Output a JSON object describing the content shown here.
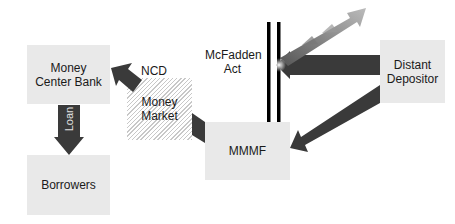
{
  "diagram": {
    "nodes": {
      "money_center_bank": "Money Center Bank",
      "borrowers": "Borrowers",
      "money_market": "Money Market",
      "mmmf": "MMMF",
      "distant_depositor": "Distant Depositor"
    },
    "labels": {
      "ncd": "NCD",
      "loan": "Loan",
      "mcfadden_act": "McFadden Act"
    },
    "edges": [
      {
        "from": "Money Center Bank",
        "to": "Borrowers",
        "label": "Loan"
      },
      {
        "from": "Money Market",
        "to": "Money Center Bank",
        "label": "NCD"
      },
      {
        "from": "MMMF",
        "to": "Money Market",
        "label": ""
      },
      {
        "from": "Distant Depositor",
        "to": "MMMF",
        "label": ""
      },
      {
        "from": "Distant Depositor",
        "to": "McFadden Act barrier",
        "label": "blocked / deflected"
      }
    ],
    "colors": {
      "box_fill": "#e9e9e9",
      "arrow_fill": "#3a3a3a",
      "barrier": "#000000"
    }
  }
}
